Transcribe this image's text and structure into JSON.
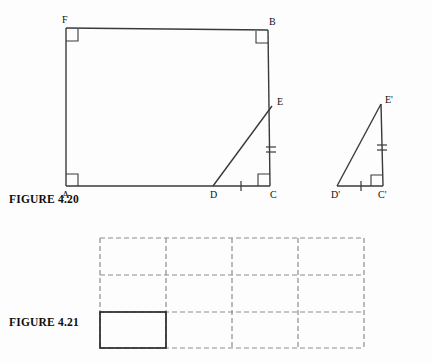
{
  "page": {
    "background_color": "#fdfdfd",
    "width": 432,
    "height": 363
  },
  "figure_420": {
    "caption": "FIGURE 4.20",
    "stroke_color": "#3a3a3a",
    "label_color": "#111111",
    "description": "Rectangle A F B C with right angles marked at A, F, B and C; triangle D E C drawn inside sharing side D C and E C, and a separate congruent triangle D prime E prime C prime to the right.",
    "quadrilateral": {
      "name": "AFBC",
      "vertices": [
        {
          "label": "F",
          "x": 66,
          "y": 28,
          "label_dx": -4,
          "label_dy": -5,
          "right_angle": true
        },
        {
          "label": "B",
          "x": 268,
          "y": 30,
          "label_dx": 1,
          "label_dy": -5,
          "right_angle": true
        },
        {
          "label": "C",
          "x": 270,
          "y": 186,
          "label_dx": 0,
          "label_dy": 12,
          "right_angle": true
        },
        {
          "label": "A",
          "x": 66,
          "y": 186,
          "label_dx": -4,
          "label_dy": 12,
          "right_angle": true
        }
      ]
    },
    "triangle_large": {
      "name": "DEC",
      "vertices": [
        {
          "label": "D",
          "x": 213,
          "y": 186,
          "label_dx": -3,
          "label_dy": 12
        },
        {
          "label": "E",
          "x": 272,
          "y": 106,
          "label_dx": 5,
          "label_dy": -2
        },
        {
          "label": "C",
          "x": 270,
          "y": 186,
          "label_dx": 0,
          "label_dy": 12
        }
      ],
      "hypotenuse": "DE",
      "tick_marks": [
        {
          "segment": "DC",
          "count": 1
        },
        {
          "segment": "EC",
          "count": 2
        }
      ]
    },
    "triangle_small": {
      "name": "D'E'C'",
      "vertices": [
        {
          "label": "D'",
          "x": 337,
          "y": 186,
          "label_dx": -6,
          "label_dy": 12
        },
        {
          "label": "E'",
          "x": 381,
          "y": 104,
          "label_dx": 4,
          "label_dy": -2
        },
        {
          "label": "C'",
          "x": 383,
          "y": 186,
          "label_dx": -2,
          "label_dy": 12
        }
      ],
      "hypotenuse": "D'E'",
      "right_angle_at": "C'",
      "tick_marks": [
        {
          "segment": "D'C'",
          "count": 1
        },
        {
          "segment": "E'C'",
          "count": 2
        }
      ]
    }
  },
  "figure_421": {
    "caption": "FIGURE 4.21",
    "grid": {
      "columns": 4,
      "rows": 3,
      "left": 100,
      "top": 238,
      "right": 364,
      "bottom": 348,
      "dash_color": "#8d8d8d",
      "dash_pattern": "5,3",
      "highlight_cell": {
        "column": 1,
        "row": 3,
        "stroke_color": "#2b2b2b"
      }
    },
    "description": "A four by three grid of dashed rectangles with the bottom left cell outlined with a solid dark border."
  }
}
